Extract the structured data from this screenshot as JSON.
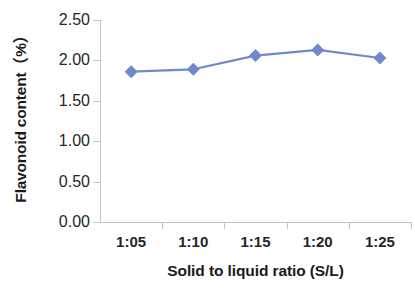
{
  "chart_data": {
    "type": "line",
    "title": "",
    "xlabel": "Solid to liquid ratio (S/L)",
    "ylabel": "Flavonoid content（%）",
    "categories": [
      "1:05",
      "1:10",
      "1:15",
      "1:20",
      "1:25"
    ],
    "values": [
      1.86,
      1.89,
      2.06,
      2.13,
      2.03
    ],
    "series": [
      {
        "name": "Flavonoid content",
        "values": [
          1.86,
          1.89,
          2.06,
          2.13,
          2.03
        ]
      }
    ],
    "ylim": [
      0.0,
      2.5
    ],
    "ytick_labels": [
      "0.00",
      "0.50",
      "1.00",
      "1.50",
      "2.00",
      "2.50"
    ],
    "ytick_values": [
      0.0,
      0.5,
      1.0,
      1.5,
      2.0,
      2.5
    ],
    "grid": false,
    "legend": "none",
    "marker": "diamond",
    "colors": {
      "series_line": "#7089cc",
      "series_marker": "#7089cc",
      "axis": "#c4c4c4",
      "text": "#262626",
      "background": "#ffffff"
    }
  }
}
